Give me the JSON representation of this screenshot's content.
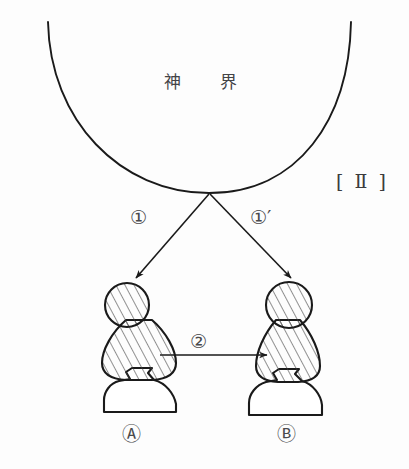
{
  "diagram": {
    "title_label": "神　界",
    "section_label": "[ Ⅱ ]",
    "arrows": [
      {
        "id": "arrow-1",
        "label": "①",
        "from": "divine-realm",
        "to": "figure-a"
      },
      {
        "id": "arrow-1p",
        "label": "①′",
        "from": "divine-realm",
        "to": "figure-b"
      },
      {
        "id": "arrow-2",
        "label": "②",
        "from": "figure-a",
        "to": "figure-b"
      }
    ],
    "figures": [
      {
        "id": "figure-a",
        "label": "Ⓐ",
        "fill": "hatched"
      },
      {
        "id": "figure-b",
        "label": "Ⓑ",
        "fill": "hatched"
      }
    ],
    "colors": {
      "stroke": "#1a1a1a",
      "background": "#fdfdfd",
      "text": "#3a3a3c",
      "hatch": "#3f3f3f"
    }
  }
}
